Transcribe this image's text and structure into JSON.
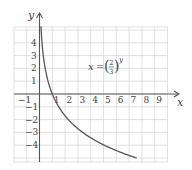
{
  "chart_data": {
    "type": "line",
    "title": "",
    "xlabel": "x",
    "ylabel": "y",
    "equation": {
      "lhs": "x",
      "equals": "=",
      "base_numerator": "2",
      "base_denominator": "3",
      "exponent": "y"
    },
    "xlim": [
      -2,
      10
    ],
    "ylim": [
      -5.3,
      5.2
    ],
    "grid": true,
    "x_ticks": [
      "-1",
      "1",
      "2",
      "3",
      "4",
      "5",
      "6",
      "7",
      "8",
      "9"
    ],
    "x_tick_values": [
      -1,
      1,
      2,
      3,
      4,
      5,
      6,
      7,
      8,
      9
    ],
    "y_ticks": [
      "4",
      "3",
      "2",
      "1",
      "-1",
      "-2",
      "-3",
      "-4"
    ],
    "y_tick_values": [
      4,
      3,
      2,
      1,
      -1,
      -2,
      -3,
      -4
    ],
    "series": [
      {
        "name": "x = (2/3)^y",
        "x": [
          0.13,
          0.2,
          0.3,
          0.44,
          0.67,
          1.0,
          1.5,
          2.25,
          3.38,
          5.06,
          7.6
        ],
        "y": [
          5.0,
          4.0,
          3.0,
          2.0,
          1.0,
          0.0,
          -1.0,
          -2.0,
          -3.0,
          -4.0,
          -5.0
        ]
      }
    ]
  },
  "labels": {
    "x_axis": "x",
    "y_axis": "y",
    "tick_neg1_x": "−1",
    "ticks_x": [
      "1",
      "2",
      "3",
      "4",
      "5",
      "6",
      "7",
      "8",
      "9"
    ],
    "ticks_y_pos": [
      "4",
      "3",
      "2",
      "1"
    ],
    "ticks_y_neg": [
      "−1",
      "−2",
      "−3",
      "−4"
    ],
    "eq_lhs": "x",
    "eq_equals": "=",
    "eq_num": "2",
    "eq_den": "3",
    "eq_exp": "y"
  }
}
